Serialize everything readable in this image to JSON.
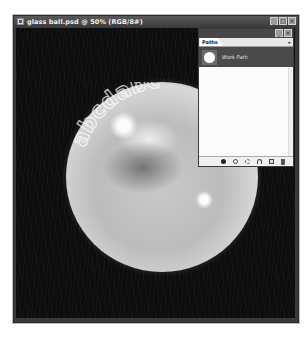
{
  "window": {
    "title": "glass ball.psd @ 50% (RGB/8#)",
    "buttons": [
      "minimize",
      "maximize",
      "close"
    ],
    "button_glyphs": {
      "minimize": "_",
      "maximize": "□",
      "close": "×"
    }
  },
  "canvas": {
    "artwork": "glass-ball",
    "ball_text": "abcdabc",
    "background_color": "#0d0d0d"
  },
  "paths_panel": {
    "tab_label": "Paths",
    "menu_arrow": "▸",
    "buttons": [
      "minimize",
      "close"
    ],
    "button_glyphs": {
      "minimize": "_",
      "close": "×"
    },
    "items": [
      {
        "name": "Work Path",
        "selected": true
      }
    ],
    "footer_icons": [
      "fill-path-icon",
      "stroke-path-icon",
      "load-as-selection-icon",
      "make-work-path-icon",
      "new-path-icon",
      "delete-path-icon"
    ]
  }
}
